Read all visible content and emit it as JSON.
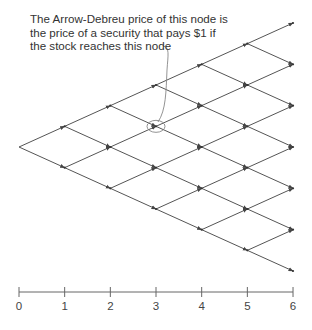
{
  "annotation": {
    "lines": [
      "The Arrow-Debreu price of this node is",
      "the price of a security that pays $1 if",
      "the stock reaches this node"
    ]
  },
  "tree": {
    "steps": 6,
    "highlight_node": {
      "t": 3,
      "ups": 2,
      "downs": 1
    },
    "line_color": "#555555"
  },
  "axis": {
    "ticks": [
      "0",
      "1",
      "2",
      "3",
      "4",
      "5",
      "6"
    ]
  }
}
